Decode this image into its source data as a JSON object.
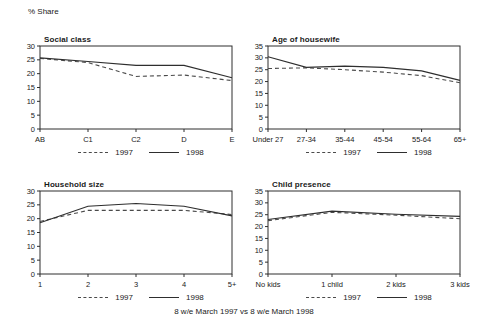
{
  "page": {
    "unit_label": "% Share",
    "caption": "8 w/e March 1997 vs 8 w/e March 1998"
  },
  "colors": {
    "line_1997": "#4a4a4a",
    "line_1998": "#2e2e2e",
    "axis": "#2e2e2e",
    "text": "#1a1a1a",
    "background": "#ffffff"
  },
  "chart_data": [
    {
      "id": "social-class",
      "type": "line",
      "title": "Social class",
      "categories": [
        "AB",
        "C1",
        "C2",
        "D",
        "E"
      ],
      "ylim": [
        0,
        30
      ],
      "ytick_step": 5,
      "grid": false,
      "legend_position": "bottom",
      "series": [
        {
          "name": "1997",
          "style": "dashed",
          "values": [
            25.5,
            24,
            19,
            19.5,
            17.5
          ]
        },
        {
          "name": "1998",
          "style": "solid",
          "values": [
            25.7,
            24.4,
            23,
            23,
            18.5
          ]
        }
      ]
    },
    {
      "id": "age-of-housewife",
      "type": "line",
      "title": "Age of housewife",
      "categories": [
        "Under 27",
        "27-34",
        "35-44",
        "45-54",
        "55-64",
        "65+"
      ],
      "ylim": [
        0,
        35
      ],
      "ytick_step": 5,
      "grid": false,
      "legend_position": "bottom",
      "series": [
        {
          "name": "1997",
          "style": "dashed",
          "values": [
            25.5,
            25.8,
            25,
            24,
            22.5,
            19.5
          ]
        },
        {
          "name": "1998",
          "style": "solid",
          "values": [
            30.5,
            26,
            26.5,
            26,
            24.5,
            20.5
          ]
        }
      ]
    },
    {
      "id": "household-size",
      "type": "line",
      "title": "Household size",
      "categories": [
        "1",
        "2",
        "3",
        "4",
        "5+"
      ],
      "ylim": [
        0,
        30
      ],
      "ytick_step": 5,
      "grid": false,
      "legend_position": "bottom",
      "series": [
        {
          "name": "1997",
          "style": "dashed",
          "values": [
            19,
            23,
            23,
            23,
            21.5
          ]
        },
        {
          "name": "1998",
          "style": "solid",
          "values": [
            18.5,
            24.5,
            25.5,
            24.5,
            21
          ]
        }
      ]
    },
    {
      "id": "child-presence",
      "type": "line",
      "title": "Child presence",
      "categories": [
        "No kids",
        "1 child",
        "2 kids",
        "3 kids"
      ],
      "ylim": [
        0,
        35
      ],
      "ytick_step": 5,
      "grid": false,
      "legend_position": "bottom",
      "series": [
        {
          "name": "1997",
          "style": "dashed",
          "values": [
            22.5,
            26,
            24.8,
            23.3
          ]
        },
        {
          "name": "1998",
          "style": "solid",
          "values": [
            23,
            26.5,
            25.2,
            24.3
          ]
        }
      ]
    }
  ]
}
